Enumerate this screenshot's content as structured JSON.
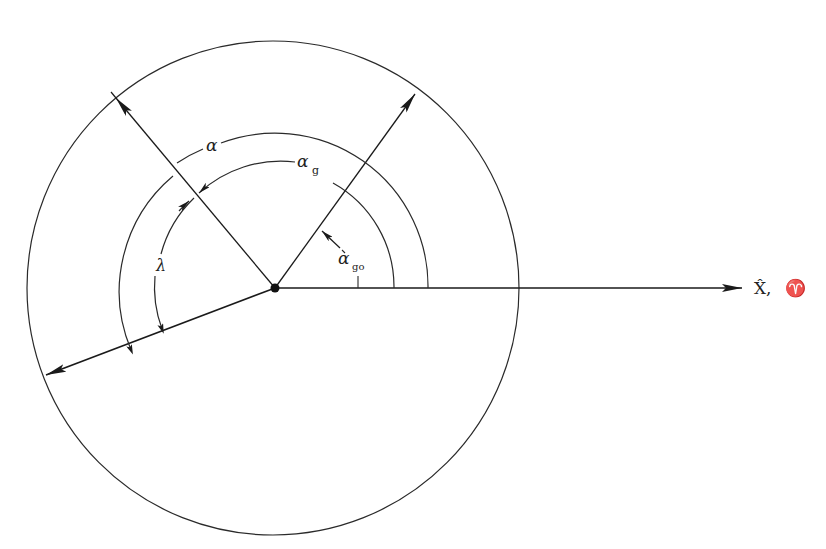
{
  "diagram": {
    "labels": {
      "alpha": "α",
      "alpha_g_base": "α",
      "alpha_g_sub": "g",
      "alpha_g0_base": "α",
      "alpha_g0_sub": "go",
      "lambda": "λ",
      "x_axis": "X̂,",
      "aries": "♈"
    },
    "colors": {
      "stroke": "#2a2a2a",
      "background": "#ffffff"
    }
  }
}
